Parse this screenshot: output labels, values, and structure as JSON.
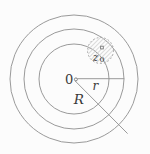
{
  "diagram": {
    "type": "concentric-circles-annulus",
    "center_label": "0",
    "inner_radius_label": "r",
    "outer_radius_label": "R",
    "point_label_main": "z",
    "point_label_sub": "0",
    "colors": {
      "background": "#fcfcfc",
      "circle_stroke": "#8e8e8e",
      "dashed_circle_stroke": "#9b9b9b",
      "hatch_stroke": "#cccccc",
      "label_text": "#3a3a3a"
    }
  }
}
